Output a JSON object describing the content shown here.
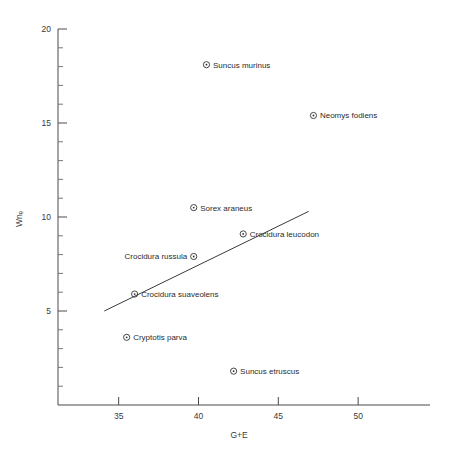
{
  "chart_data": {
    "type": "scatter",
    "title": "",
    "subtitle": "",
    "xlabel": "G+E",
    "ylabel": "Wnₑ",
    "xlim": [
      31.2,
      54.5
    ],
    "ylim": [
      0.0,
      20.0
    ],
    "grid": false,
    "legend": "none",
    "x_ticks_major": [
      35,
      40,
      45,
      50
    ],
    "x_tick_labels": [
      "35",
      "40",
      "45",
      "50"
    ],
    "y_ticks_major": [
      5,
      10,
      15,
      20
    ],
    "y_tick_labels": [
      "5",
      "10",
      "15",
      "20"
    ],
    "y_minor_step": 1,
    "points": [
      {
        "label": "Suncus murinus",
        "x": 40.5,
        "y": 18.1,
        "label_side": "right"
      },
      {
        "label": "Neomys fodiens",
        "x": 47.2,
        "y": 15.4,
        "label_side": "right"
      },
      {
        "label": "Sorex araneus",
        "x": 39.7,
        "y": 10.5,
        "label_side": "right"
      },
      {
        "label": "Crocidura leucodon",
        "x": 42.8,
        "y": 9.1,
        "label_side": "right"
      },
      {
        "label": "Crocidura russula",
        "x": 39.7,
        "y": 7.9,
        "label_side": "left"
      },
      {
        "label": "Crocidura suaveolens",
        "x": 36.0,
        "y": 5.9,
        "label_side": "right"
      },
      {
        "label": "Cryptotis parva",
        "x": 35.5,
        "y": 3.6,
        "label_side": "right"
      },
      {
        "label": "Suncus etruscus",
        "x": 42.2,
        "y": 1.8,
        "label_side": "right"
      }
    ],
    "fit_line": {
      "name": "regression-line",
      "x_start": 34.1,
      "y_start": 5.0,
      "x_end": 46.9,
      "y_end": 10.3
    },
    "colors": {
      "axis": "#4a4a4a",
      "marker": "#333333",
      "text": "#2b2b2b",
      "line": "#3a3a3a",
      "background": "#ffffff"
    }
  }
}
